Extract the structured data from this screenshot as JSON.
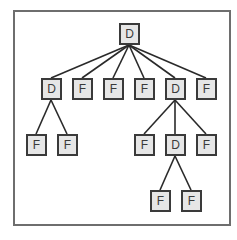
{
  "diagram": {
    "type": "tree",
    "colors": {
      "frame": "#6e6e6e",
      "node_border": "#3a3a3a",
      "node_fill": "#e6e6e6",
      "edge": "#2a2a2a"
    },
    "nodes": [
      {
        "id": "n0",
        "label": "D",
        "x": 129,
        "y": 34
      },
      {
        "id": "n1",
        "label": "D",
        "x": 51,
        "y": 89
      },
      {
        "id": "n2",
        "label": "F",
        "x": 82,
        "y": 89
      },
      {
        "id": "n3",
        "label": "F",
        "x": 113,
        "y": 89
      },
      {
        "id": "n4",
        "label": "F",
        "x": 144,
        "y": 89
      },
      {
        "id": "n5",
        "label": "D",
        "x": 175,
        "y": 89
      },
      {
        "id": "n6",
        "label": "F",
        "x": 206,
        "y": 89
      },
      {
        "id": "n7",
        "label": "F",
        "x": 36,
        "y": 145
      },
      {
        "id": "n8",
        "label": "F",
        "x": 67,
        "y": 145
      },
      {
        "id": "n9",
        "label": "F",
        "x": 144,
        "y": 145
      },
      {
        "id": "n10",
        "label": "D",
        "x": 175,
        "y": 145
      },
      {
        "id": "n11",
        "label": "F",
        "x": 206,
        "y": 145
      },
      {
        "id": "n12",
        "label": "F",
        "x": 160,
        "y": 201
      },
      {
        "id": "n13",
        "label": "F",
        "x": 191,
        "y": 201
      }
    ],
    "edges": [
      [
        "n0",
        "n1"
      ],
      [
        "n0",
        "n2"
      ],
      [
        "n0",
        "n3"
      ],
      [
        "n0",
        "n4"
      ],
      [
        "n0",
        "n5"
      ],
      [
        "n0",
        "n6"
      ],
      [
        "n1",
        "n7"
      ],
      [
        "n1",
        "n8"
      ],
      [
        "n5",
        "n9"
      ],
      [
        "n5",
        "n10"
      ],
      [
        "n5",
        "n11"
      ],
      [
        "n10",
        "n12"
      ],
      [
        "n10",
        "n13"
      ]
    ]
  }
}
